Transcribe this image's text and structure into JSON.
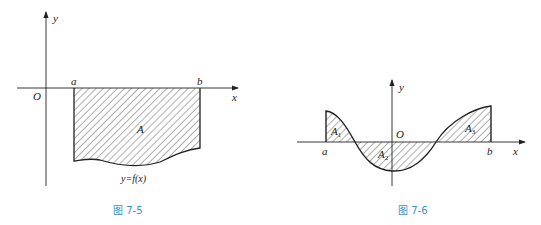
{
  "figures": [
    {
      "id": "fig-7-5",
      "caption": "图 7-5",
      "labels": {
        "y_axis": "y",
        "x_axis": "x",
        "origin": "O",
        "a": "a",
        "b": "b",
        "area": "A",
        "curve": "y=f(x)"
      }
    },
    {
      "id": "fig-7-6",
      "caption": "图 7-6",
      "labels": {
        "y_axis": "y",
        "x_axis": "x",
        "origin": "O",
        "a": "a",
        "b": "b",
        "area1": "A",
        "area1_sub": "1",
        "area2": "A",
        "area2_sub": "2",
        "area3": "A",
        "area3_sub": "3"
      }
    }
  ],
  "colors": {
    "caption": "#3a8fd6",
    "line": "#222222"
  }
}
